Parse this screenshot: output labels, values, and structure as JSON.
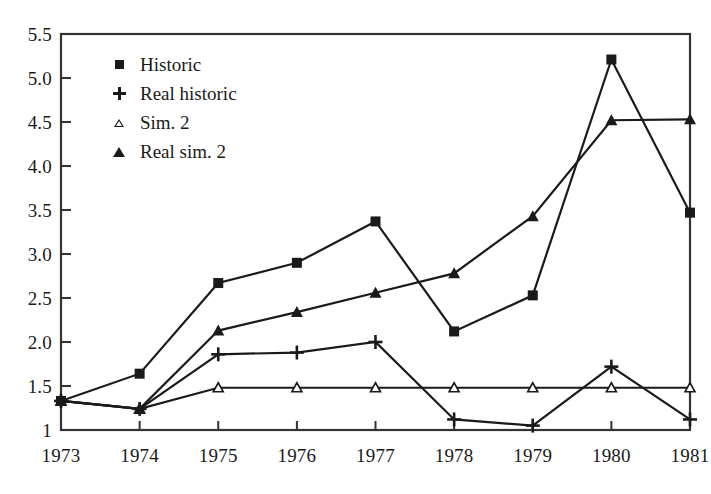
{
  "chart_data": {
    "type": "line",
    "title": "",
    "subtitle": "",
    "xlabel": "",
    "ylabel": "",
    "categories": [
      "1973",
      "1974",
      "1975",
      "1976",
      "1977",
      "1978",
      "1979",
      "1980",
      "1981"
    ],
    "x": [
      1973,
      1974,
      1975,
      1976,
      1977,
      1978,
      1979,
      1980,
      1981
    ],
    "xlim": [
      1973,
      1981
    ],
    "ylim": [
      1,
      5.5
    ],
    "grid": false,
    "legend_position": "upper-left-inside",
    "y_ticks": [
      "5.5",
      "5.0",
      "4.5",
      "4.0",
      "3.5",
      "3.0",
      "2.5",
      "2.0",
      "1.5",
      "1"
    ],
    "y_tick_values": [
      5.5,
      5.0,
      4.5,
      4.0,
      3.5,
      3.0,
      2.5,
      2.0,
      1.5,
      1.0
    ],
    "series": [
      {
        "name": "Historic",
        "marker": "filled-square",
        "values": [
          1.33,
          1.64,
          2.67,
          2.9,
          3.37,
          2.12,
          2.53,
          5.21,
          3.47
        ]
      },
      {
        "name": "Real historic",
        "marker": "plus",
        "values": [
          1.33,
          1.24,
          1.86,
          1.88,
          2.0,
          1.12,
          1.05,
          1.72,
          1.12
        ]
      },
      {
        "name": "Sim. 2",
        "marker": "open-triangle",
        "values": [
          1.33,
          1.24,
          1.48,
          1.48,
          1.48,
          1.48,
          1.48,
          1.48,
          1.48
        ]
      },
      {
        "name": "Real sim. 2",
        "marker": "filled-triangle",
        "values": [
          1.33,
          1.24,
          2.13,
          2.34,
          2.56,
          2.78,
          3.43,
          4.52,
          4.53
        ]
      }
    ]
  },
  "legend": {
    "items": [
      {
        "label": "Historic",
        "marker": "filled-square-icon"
      },
      {
        "label": "Real historic",
        "marker": "plus-icon"
      },
      {
        "label": "Sim. 2",
        "marker": "open-triangle-icon"
      },
      {
        "label": "Real sim. 2",
        "marker": "filled-triangle-icon"
      }
    ]
  },
  "colors": {
    "line": "#1a1a1a",
    "axis": "#333333",
    "background": "#ffffff"
  }
}
